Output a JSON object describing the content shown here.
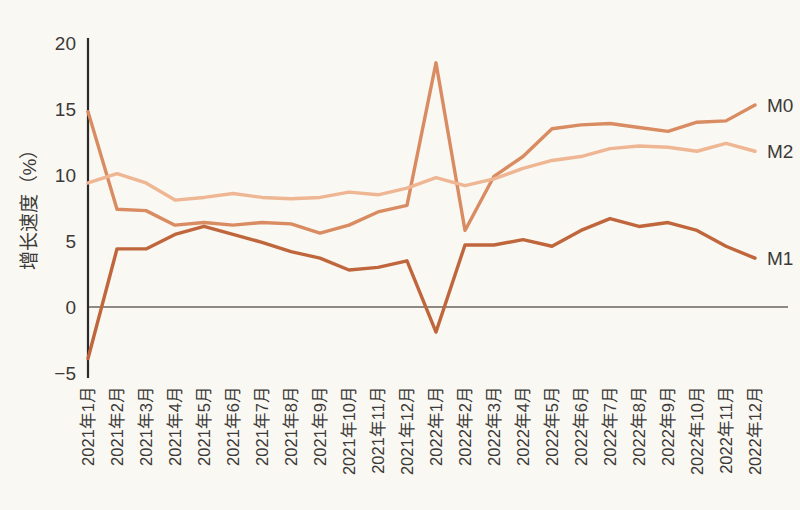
{
  "chart_data": {
    "type": "line",
    "title": "",
    "xlabel": "",
    "ylabel": "增长速度（%）",
    "ylim": [
      -5,
      20
    ],
    "yticks": [
      -5,
      0,
      5,
      10,
      15,
      20
    ],
    "ytick_labels": [
      "−5",
      "0",
      "5",
      "10",
      "15",
      "20"
    ],
    "grid": false,
    "zero_line": true,
    "legend_position": "right-inline",
    "categories": [
      "2021年1月",
      "2021年2月",
      "2021年3月",
      "2021年4月",
      "2021年5月",
      "2021年6月",
      "2021年7月",
      "2021年8月",
      "2021年9月",
      "2021年10月",
      "2021年11月",
      "2021年12月",
      "2022年1月",
      "2022年2月",
      "2022年3月",
      "2022年4月",
      "2022年5月",
      "2022年6月",
      "2022年7月",
      "2022年8月",
      "2022年9月",
      "2022年10月",
      "2022年11月",
      "2022年12月"
    ],
    "series": [
      {
        "name": "M0",
        "color": "#d98b61",
        "values": [
          14.8,
          7.4,
          7.3,
          6.2,
          6.4,
          6.2,
          6.4,
          6.3,
          5.6,
          6.2,
          7.2,
          7.7,
          18.5,
          5.8,
          9.9,
          11.4,
          13.5,
          13.8,
          13.9,
          13.6,
          13.3,
          14.0,
          14.1,
          15.3
        ],
        "label_y": 15.3
      },
      {
        "name": "M2",
        "color": "#efb693",
        "values": [
          9.4,
          10.1,
          9.4,
          8.1,
          8.3,
          8.6,
          8.3,
          8.2,
          8.3,
          8.7,
          8.5,
          9.0,
          9.8,
          9.2,
          9.7,
          10.5,
          11.1,
          11.4,
          12.0,
          12.2,
          12.1,
          11.8,
          12.4,
          11.8
        ],
        "label_y": 11.8
      },
      {
        "name": "M1",
        "color": "#c0663c",
        "values": [
          -3.9,
          4.4,
          4.4,
          5.5,
          6.1,
          5.5,
          4.9,
          4.2,
          3.7,
          2.8,
          3.0,
          3.5,
          -1.9,
          4.7,
          4.7,
          5.1,
          4.6,
          5.8,
          6.7,
          6.1,
          6.4,
          5.8,
          4.6,
          3.7
        ],
        "label_y": 3.7
      }
    ]
  },
  "colors": {
    "background": "#faf8f3",
    "axis": "#2b2a28",
    "zero_line": "#6a6560",
    "text": "#3c3a38"
  }
}
